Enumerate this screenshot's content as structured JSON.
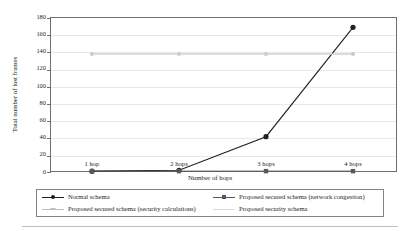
{
  "chart_data": {
    "type": "line",
    "title": "",
    "xlabel": "Number of hops",
    "ylabel": "Total number of lost frames",
    "categories": [
      "1 hop",
      "2 hops",
      "3 hops",
      "4 hops"
    ],
    "ylim": [
      0,
      180
    ],
    "ytick_step": 20,
    "yticks": [
      0,
      20,
      40,
      60,
      80,
      100,
      120,
      140,
      160,
      180
    ],
    "grid": "horizontal",
    "legend_position": "bottom",
    "series": [
      {
        "name": "Normal schema",
        "values": [
          1,
          2,
          41,
          168
        ],
        "color": "#231f20",
        "marker": "circle"
      },
      {
        "name": "Proposed secured schema (network congestion)",
        "values": [
          1,
          1,
          1,
          1
        ],
        "color": "#58595b",
        "marker": "square"
      },
      {
        "name": "Proposed secured schema (security calculations)",
        "values": [
          137,
          137,
          137,
          137
        ],
        "color": "#bcbec0",
        "marker": "dash"
      },
      {
        "name": "Proposed security schema",
        "values": [
          137,
          137,
          137,
          137
        ],
        "color": "#d9dadb",
        "marker": "none"
      }
    ]
  },
  "axis": {
    "ytick_labels": [
      "180",
      "160",
      "140",
      "120",
      "100",
      "80",
      "60",
      "40",
      "20",
      "0"
    ],
    "xtick_labels": [
      "1 hop",
      "2 hops",
      "3 hops",
      "4 hops"
    ],
    "x_title": "Number of hops",
    "y_title": "Total number of lost frames"
  },
  "legend": {
    "items": [
      {
        "label": "Normal schema",
        "color": "#231f20",
        "marker": "circle"
      },
      {
        "label": "Proposed secured schema (network congestion)",
        "color": "#58595b",
        "marker": "square"
      },
      {
        "label": "Proposed secured schema (security calculations)",
        "color": "#bcbec0",
        "marker": "dash"
      },
      {
        "label": "Proposed security schema",
        "color": "#d9dadb",
        "marker": "none"
      }
    ]
  }
}
